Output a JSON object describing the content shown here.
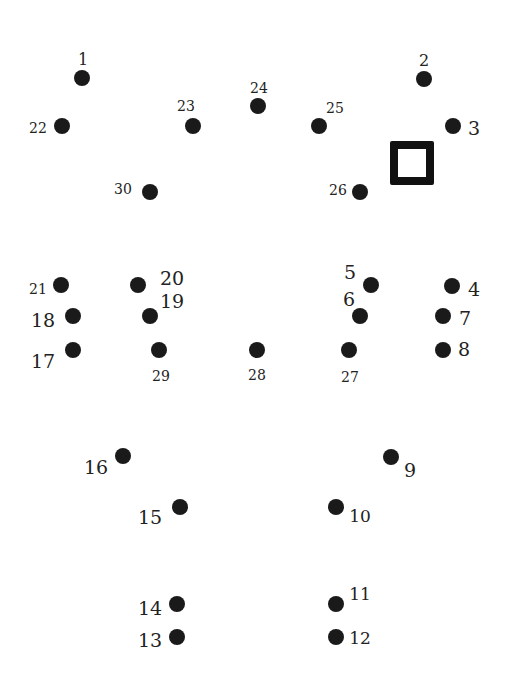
{
  "puzzle": {
    "type": "connect-the-dots",
    "dot_count": 30,
    "colors": {
      "dot": "#1a1a1a",
      "label": "#222222",
      "background": "#ffffff"
    },
    "dots": [
      {
        "n": "1",
        "x": 82,
        "y": 78,
        "lx": 83,
        "ly": 60,
        "size": 16
      },
      {
        "n": "2",
        "x": 424,
        "y": 79,
        "lx": 424,
        "ly": 61,
        "size": 16
      },
      {
        "n": "3",
        "x": 453,
        "y": 126,
        "lx": 474,
        "ly": 128,
        "size": 19
      },
      {
        "n": "4",
        "x": 452,
        "y": 286,
        "lx": 474,
        "ly": 289,
        "size": 19
      },
      {
        "n": "5",
        "x": 371,
        "y": 285,
        "lx": 350,
        "ly": 272,
        "size": 19
      },
      {
        "n": "6",
        "x": 360,
        "y": 316,
        "lx": 349,
        "ly": 299,
        "size": 19
      },
      {
        "n": "7",
        "x": 443,
        "y": 316,
        "lx": 465,
        "ly": 318,
        "size": 19
      },
      {
        "n": "8",
        "x": 443,
        "y": 350,
        "lx": 464,
        "ly": 349,
        "size": 19
      },
      {
        "n": "9",
        "x": 391,
        "y": 457,
        "lx": 410,
        "ly": 470,
        "size": 19
      },
      {
        "n": "10",
        "x": 336,
        "y": 507,
        "lx": 360,
        "ly": 516,
        "size": 17
      },
      {
        "n": "11",
        "x": 336,
        "y": 604,
        "lx": 360,
        "ly": 594,
        "size": 17
      },
      {
        "n": "12",
        "x": 336,
        "y": 637,
        "lx": 360,
        "ly": 638,
        "size": 17
      },
      {
        "n": "13",
        "x": 177,
        "y": 637,
        "lx": 150,
        "ly": 640,
        "size": 19
      },
      {
        "n": "14",
        "x": 177,
        "y": 604,
        "lx": 150,
        "ly": 608,
        "size": 19
      },
      {
        "n": "15",
        "x": 180,
        "y": 507,
        "lx": 150,
        "ly": 517,
        "size": 19
      },
      {
        "n": "16",
        "x": 123,
        "y": 456,
        "lx": 96,
        "ly": 467,
        "size": 19
      },
      {
        "n": "17",
        "x": 73,
        "y": 350,
        "lx": 43,
        "ly": 361,
        "size": 19
      },
      {
        "n": "18",
        "x": 73,
        "y": 316,
        "lx": 43,
        "ly": 320,
        "size": 19
      },
      {
        "n": "19",
        "x": 150,
        "y": 316,
        "lx": 172,
        "ly": 301,
        "size": 19
      },
      {
        "n": "20",
        "x": 138,
        "y": 285,
        "lx": 172,
        "ly": 278,
        "size": 19
      },
      {
        "n": "21",
        "x": 61,
        "y": 285,
        "lx": 38,
        "ly": 289,
        "size": 14
      },
      {
        "n": "22",
        "x": 62,
        "y": 126,
        "lx": 38,
        "ly": 128,
        "size": 14
      },
      {
        "n": "23",
        "x": 193,
        "y": 126,
        "lx": 186,
        "ly": 106,
        "size": 14
      },
      {
        "n": "24",
        "x": 258,
        "y": 106,
        "lx": 259,
        "ly": 88,
        "size": 14
      },
      {
        "n": "25",
        "x": 319,
        "y": 126,
        "lx": 335,
        "ly": 108,
        "size": 14
      },
      {
        "n": "26",
        "x": 360,
        "y": 192,
        "lx": 338,
        "ly": 190,
        "size": 14
      },
      {
        "n": "27",
        "x": 349,
        "y": 350,
        "lx": 350,
        "ly": 377,
        "size": 14
      },
      {
        "n": "28",
        "x": 257,
        "y": 350,
        "lx": 257,
        "ly": 375,
        "size": 14
      },
      {
        "n": "29",
        "x": 159,
        "y": 350,
        "lx": 161,
        "ly": 376,
        "size": 14
      },
      {
        "n": "30",
        "x": 150,
        "y": 192,
        "lx": 123,
        "ly": 189,
        "size": 14
      }
    ],
    "marker": {
      "shape": "hollow-square",
      "x": 390,
      "y": 141,
      "size": 44,
      "stroke": 8,
      "color": "#111111"
    }
  }
}
